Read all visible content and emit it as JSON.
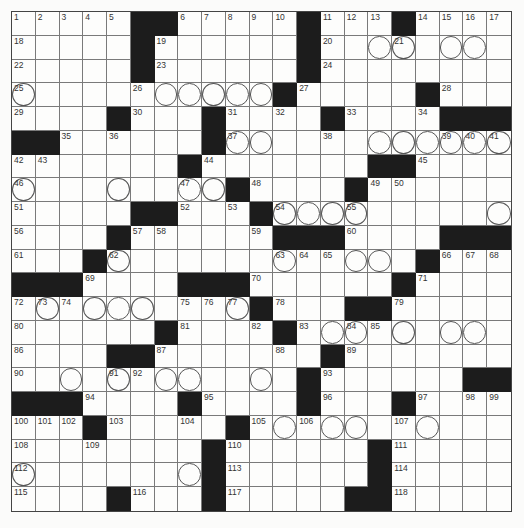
{
  "puzzle": {
    "rows": 21,
    "cols": 21,
    "colors": {
      "black": "#1c1c1c",
      "white": "#fdfdfc",
      "line": "#7a7a7a"
    },
    "layout": [
      ".....##.....#...#....",
      ".....#......#........",
      ".....#......#........",
      "...........#.....#...",
      "....#...#....#....###",
      "##......#............",
      ".......#.......##....",
      ".........#....#......",
      ".....##...#..........",
      "....#......###....###",
      "...#.............#...",
      "###....###......#....",
      "..........#...##.....",
      "......#....#.........",
      "....##.......#.......",
      "............#......##",
      "###....#....#...#....",
      "...#.....#...........",
      "........#......#.....",
      "........#......#.....",
      "....#...#.....##....."
    ],
    "numbers": [
      [
        0,
        0,
        "1"
      ],
      [
        0,
        1,
        "2"
      ],
      [
        0,
        2,
        "3"
      ],
      [
        0,
        3,
        "4"
      ],
      [
        0,
        4,
        "5"
      ],
      [
        0,
        7,
        "6"
      ],
      [
        0,
        8,
        "7"
      ],
      [
        0,
        9,
        "8"
      ],
      [
        0,
        10,
        "9"
      ],
      [
        0,
        11,
        "10"
      ],
      [
        0,
        13,
        "11"
      ],
      [
        0,
        14,
        "12"
      ],
      [
        0,
        15,
        "13"
      ],
      [
        0,
        17,
        "14"
      ],
      [
        0,
        18,
        "15"
      ],
      [
        0,
        19,
        "16"
      ],
      [
        0,
        20,
        "17"
      ],
      [
        1,
        0,
        "18"
      ],
      [
        1,
        6,
        "19"
      ],
      [
        1,
        13,
        "20"
      ],
      [
        1,
        16,
        "21"
      ],
      [
        2,
        0,
        "22"
      ],
      [
        2,
        6,
        "23"
      ],
      [
        2,
        13,
        "24"
      ],
      [
        3,
        0,
        "25"
      ],
      [
        3,
        5,
        "26"
      ],
      [
        3,
        12,
        "27"
      ],
      [
        3,
        18,
        "28"
      ],
      [
        4,
        0,
        "29"
      ],
      [
        4,
        5,
        "30"
      ],
      [
        4,
        9,
        "31"
      ],
      [
        4,
        11,
        "32"
      ],
      [
        4,
        14,
        "33"
      ],
      [
        4,
        17,
        "34"
      ],
      [
        5,
        2,
        "35"
      ],
      [
        5,
        4,
        "36"
      ],
      [
        5,
        9,
        "37"
      ],
      [
        5,
        13,
        "38"
      ],
      [
        5,
        18,
        "39"
      ],
      [
        5,
        19,
        "40"
      ],
      [
        5,
        20,
        "41"
      ],
      [
        6,
        0,
        "42"
      ],
      [
        6,
        1,
        "43"
      ],
      [
        6,
        8,
        "44"
      ],
      [
        6,
        17,
        "45"
      ],
      [
        7,
        0,
        "46"
      ],
      [
        7,
        7,
        "47"
      ],
      [
        7,
        10,
        "48"
      ],
      [
        7,
        15,
        "49"
      ],
      [
        7,
        16,
        "50"
      ],
      [
        8,
        0,
        "51"
      ],
      [
        8,
        7,
        "52"
      ],
      [
        8,
        9,
        "53"
      ],
      [
        8,
        11,
        "54"
      ],
      [
        8,
        14,
        "55"
      ],
      [
        9,
        0,
        "56"
      ],
      [
        9,
        5,
        "57"
      ],
      [
        9,
        6,
        "58"
      ],
      [
        9,
        10,
        "59"
      ],
      [
        9,
        14,
        "60"
      ],
      [
        10,
        0,
        "61"
      ],
      [
        10,
        4,
        "62"
      ],
      [
        10,
        11,
        "63"
      ],
      [
        10,
        12,
        "64"
      ],
      [
        10,
        13,
        "65"
      ],
      [
        10,
        18,
        "66"
      ],
      [
        10,
        19,
        "67"
      ],
      [
        10,
        20,
        "68"
      ],
      [
        11,
        3,
        "69"
      ],
      [
        11,
        10,
        "70"
      ],
      [
        11,
        17,
        "71"
      ],
      [
        12,
        0,
        "72"
      ],
      [
        12,
        1,
        "73"
      ],
      [
        12,
        2,
        "74"
      ],
      [
        12,
        7,
        "75"
      ],
      [
        12,
        8,
        "76"
      ],
      [
        12,
        9,
        "77"
      ],
      [
        12,
        11,
        "78"
      ],
      [
        12,
        16,
        "79"
      ],
      [
        13,
        0,
        "80"
      ],
      [
        13,
        7,
        "81"
      ],
      [
        13,
        10,
        "82"
      ],
      [
        13,
        12,
        "83"
      ],
      [
        13,
        14,
        "84"
      ],
      [
        13,
        15,
        "85"
      ],
      [
        14,
        0,
        "86"
      ],
      [
        14,
        6,
        "87"
      ],
      [
        14,
        11,
        "88"
      ],
      [
        14,
        14,
        "89"
      ],
      [
        15,
        0,
        "90"
      ],
      [
        15,
        4,
        "91"
      ],
      [
        15,
        5,
        "92"
      ],
      [
        15,
        13,
        "93"
      ],
      [
        16,
        3,
        "94"
      ],
      [
        16,
        8,
        "95"
      ],
      [
        16,
        13,
        "96"
      ],
      [
        16,
        17,
        "97"
      ],
      [
        16,
        19,
        "98"
      ],
      [
        16,
        20,
        "99"
      ],
      [
        17,
        0,
        "100"
      ],
      [
        17,
        1,
        "101"
      ],
      [
        17,
        2,
        "102"
      ],
      [
        17,
        4,
        "103"
      ],
      [
        17,
        7,
        "104"
      ],
      [
        17,
        10,
        "105"
      ],
      [
        17,
        12,
        "106"
      ],
      [
        17,
        16,
        "107"
      ],
      [
        18,
        0,
        "108"
      ],
      [
        18,
        3,
        "109"
      ],
      [
        18,
        9,
        "110"
      ],
      [
        18,
        16,
        "111"
      ],
      [
        19,
        0,
        "112"
      ],
      [
        19,
        9,
        "113"
      ],
      [
        19,
        16,
        "114"
      ],
      [
        20,
        0,
        "115"
      ],
      [
        20,
        5,
        "116"
      ],
      [
        20,
        9,
        "117"
      ],
      [
        20,
        16,
        "118"
      ]
    ],
    "circles": [
      [
        1,
        15
      ],
      [
        1,
        16
      ],
      [
        1,
        18
      ],
      [
        1,
        19
      ],
      [
        3,
        0
      ],
      [
        3,
        6
      ],
      [
        3,
        7
      ],
      [
        3,
        8
      ],
      [
        3,
        9
      ],
      [
        3,
        10
      ],
      [
        5,
        9
      ],
      [
        5,
        10
      ],
      [
        5,
        15
      ],
      [
        5,
        16
      ],
      [
        5,
        17
      ],
      [
        5,
        18
      ],
      [
        5,
        19
      ],
      [
        5,
        20
      ],
      [
        7,
        0
      ],
      [
        7,
        4
      ],
      [
        7,
        7
      ],
      [
        7,
        8
      ],
      [
        8,
        11
      ],
      [
        8,
        12
      ],
      [
        8,
        13
      ],
      [
        8,
        14
      ],
      [
        8,
        20
      ],
      [
        10,
        4
      ],
      [
        10,
        11
      ],
      [
        10,
        14
      ],
      [
        10,
        15
      ],
      [
        12,
        1
      ],
      [
        12,
        3
      ],
      [
        12,
        4
      ],
      [
        12,
        5
      ],
      [
        12,
        9
      ],
      [
        13,
        13
      ],
      [
        13,
        14
      ],
      [
        13,
        16
      ],
      [
        13,
        18
      ],
      [
        13,
        19
      ],
      [
        15,
        2
      ],
      [
        15,
        4
      ],
      [
        15,
        6
      ],
      [
        15,
        7
      ],
      [
        15,
        10
      ],
      [
        17,
        11
      ],
      [
        17,
        13
      ],
      [
        17,
        14
      ],
      [
        17,
        17
      ],
      [
        19,
        0
      ],
      [
        19,
        7
      ]
    ]
  }
}
